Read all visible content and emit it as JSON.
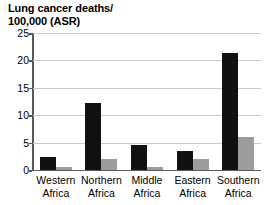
{
  "chart_data": {
    "type": "bar",
    "title": "Lung cancer deaths/\n100,000 (ASR)",
    "title_line1": "Lung cancer deaths/",
    "title_line2": "100,000 (ASR)",
    "xlabel": "",
    "ylabel": "",
    "ylim": [
      0,
      25
    ],
    "yticks": [
      0,
      5,
      10,
      15,
      20,
      25
    ],
    "ytick_labels": [
      "0",
      "5",
      "10",
      "15",
      "20",
      "25"
    ],
    "grid": true,
    "grid_axis": "y",
    "legend": false,
    "legend_position": "none",
    "categories": [
      "Western\nAfrica",
      "Northern\nAfrica",
      "Middle\nAfrica",
      "Eastern\nAfrica",
      "Southern\nAfrica"
    ],
    "category_labels": [
      {
        "line1": "Western",
        "line2": "Africa"
      },
      {
        "line1": "Northern",
        "line2": "Africa"
      },
      {
        "line1": "Middle",
        "line2": "Africa"
      },
      {
        "line1": "Eastern",
        "line2": "Africa"
      },
      {
        "line1": "Southern",
        "line2": "Africa"
      }
    ],
    "series": [
      {
        "name": "Male",
        "color": "#111111",
        "values": [
          2.4,
          12.2,
          4.6,
          3.4,
          21.4
        ]
      },
      {
        "name": "Female",
        "color": "#9a9c9d",
        "values": [
          0.6,
          2.1,
          0.6,
          2.1,
          6.0
        ]
      }
    ]
  },
  "colors": {
    "series_dark": "#111111",
    "series_light": "#9a9c9d",
    "axis": "#555a5c",
    "gridline": "#c9cbcc",
    "background": "#ffffff",
    "text": "#000000"
  }
}
